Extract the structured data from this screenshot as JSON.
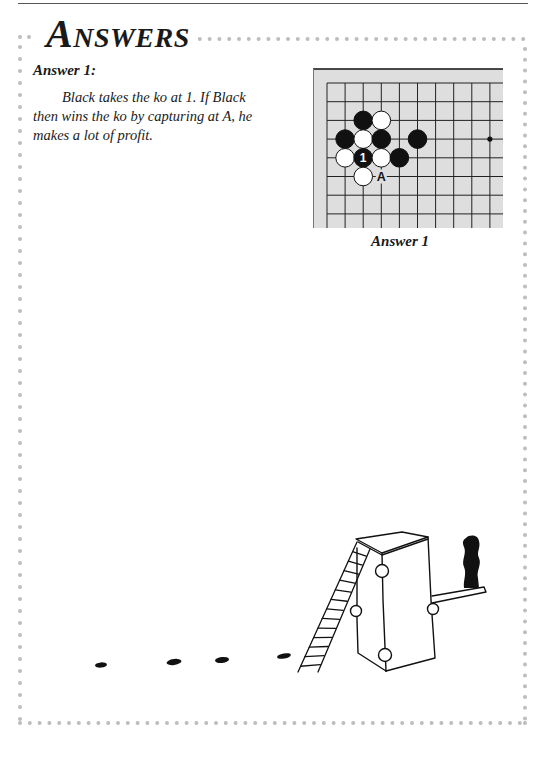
{
  "page": {
    "title": "Answers",
    "section_heading": "Answer 1:",
    "body": "Black takes the ko at 1. If Black then wins the ko by capturing at A, he makes a lot of profit.",
    "figure_caption": "Answer 1"
  },
  "colors": {
    "frame_dots": "#bdbdbd",
    "top_rule": "#555555",
    "board_bg": "#dedede",
    "grid_line": "#222222",
    "black_stone": "#111111",
    "white_stone": "#ffffff"
  },
  "board": {
    "grid_origin": [
      327,
      83
    ],
    "spacing": [
      18.1,
      18.7
    ],
    "columns": 10,
    "rows": 8,
    "edges": [
      "top",
      "left"
    ],
    "hoshi": [
      [
        9,
        3
      ]
    ],
    "stones": [
      {
        "col": 2,
        "row": 2,
        "color": "black"
      },
      {
        "col": 3,
        "row": 2,
        "color": "white"
      },
      {
        "col": 1,
        "row": 3,
        "color": "black"
      },
      {
        "col": 2,
        "row": 3,
        "color": "white"
      },
      {
        "col": 3,
        "row": 3,
        "color": "black"
      },
      {
        "col": 5,
        "row": 3,
        "color": "black"
      },
      {
        "col": 1,
        "row": 4,
        "color": "white"
      },
      {
        "col": 2,
        "row": 4,
        "color": "black",
        "label": "1"
      },
      {
        "col": 3,
        "row": 4,
        "color": "white"
      },
      {
        "col": 4,
        "row": 4,
        "color": "black"
      },
      {
        "col": 2,
        "row": 5,
        "color": "white"
      }
    ],
    "markers": [
      {
        "col": 3,
        "row": 5,
        "label": "A"
      }
    ]
  },
  "illustration": {
    "subject": "hand-drawn tall box with ladder, side platform and chimney, with footprints leading to it",
    "footprints": [
      {
        "cx": 101,
        "cy": 665,
        "rx": 6,
        "ry": 2.6,
        "rot": -5
      },
      {
        "cx": 174,
        "cy": 662,
        "rx": 7.5,
        "ry": 3,
        "rot": -8
      },
      {
        "cx": 222,
        "cy": 660,
        "rx": 7,
        "ry": 3,
        "rot": -6
      },
      {
        "cx": 284,
        "cy": 656,
        "rx": 7,
        "ry": 2.6,
        "rot": -10
      }
    ]
  }
}
